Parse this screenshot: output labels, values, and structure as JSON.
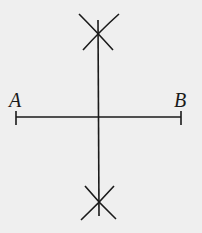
{
  "diagram": {
    "type": "geometric-construction",
    "colors": {
      "background": "#efefef",
      "stroke": "#1a1a1a"
    },
    "points": [
      {
        "id": "A",
        "label": "A",
        "x": 16,
        "y": 117
      },
      {
        "id": "B",
        "label": "B",
        "x": 181,
        "y": 117
      }
    ],
    "segment": {
      "from": "A",
      "to": "B"
    },
    "bisector": {
      "x": 98,
      "y_top": 20,
      "y_bottom": 215
    },
    "arc_intersections": [
      {
        "position": "top",
        "x": 98,
        "y": 30
      },
      {
        "position": "bottom",
        "x": 99,
        "y": 204
      }
    ]
  },
  "labels": {
    "a": "A",
    "b": "B"
  }
}
